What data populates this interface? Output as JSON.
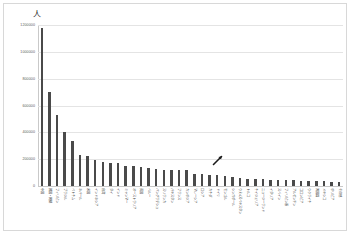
{
  "chart_data": {
    "type": "bar",
    "title": "",
    "xlabel": "",
    "ylabel": "",
    "unit_label": "人",
    "ylim": [
      0,
      1200000
    ],
    "ytick_values": [
      0,
      200000,
      400000,
      600000,
      800000,
      1000000,
      1200000
    ],
    "ytick_labels": [
      "0",
      "200000",
      "400000",
      "600000",
      "800000",
      "1000000",
      "1200000"
    ],
    "grid": true,
    "legend": "none",
    "bar_color": "#4a4a4a",
    "categories": [
      "中国",
      "韓国・朝鮮",
      "フィリピン",
      "ブラジル",
      "ベトナム",
      "ネパール",
      "米国",
      "インドネシア",
      "台湾",
      "タイ",
      "インド",
      "ミャンマー",
      "オーストラリア",
      "英国",
      "ペルー",
      "バングラデシュ",
      "スリランカ",
      "パキスタン",
      "フランス",
      "カンボジア",
      "マレーシア",
      "ロシア",
      "カナダ",
      "ドイツ",
      "モンゴル",
      "シンガポール",
      "ウぇ4ズベキスタン",
      "トルコ",
      "ナイジェリア",
      "ニュージーランド",
      "イタリア",
      "スペイン",
      "フィリピン系",
      "アルゼンチン",
      "コロンビア",
      "ウクライナ",
      "無国籍",
      "メキシコ",
      "ボリビア",
      "その他"
    ],
    "values": [
      1180000,
      700000,
      530000,
      400000,
      335000,
      230000,
      225000,
      193000,
      178000,
      175000,
      172000,
      152000,
      150000,
      140000,
      132000,
      130000,
      120000,
      118000,
      117000,
      117000,
      92000,
      88000,
      85000,
      80000,
      72000,
      67000,
      60000,
      55000,
      52000,
      50000,
      48000,
      46000,
      44000,
      42000,
      40000,
      38000,
      36000,
      34000,
      32000,
      30000
    ],
    "annotation": {
      "type": "arrow",
      "target_category_index": 25,
      "label": ""
    }
  }
}
